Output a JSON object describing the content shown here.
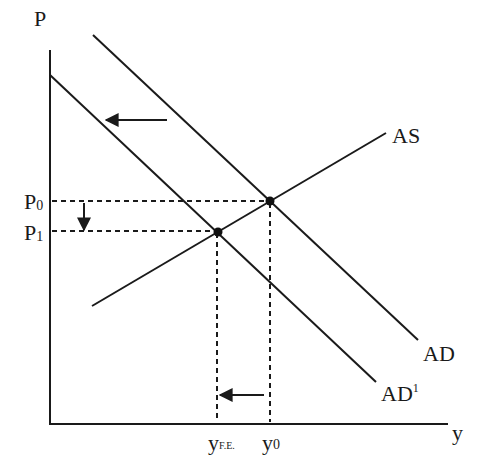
{
  "diagram": {
    "type": "aggregate supply / aggregate demand shift",
    "axes": {
      "y_label": "P",
      "x_label": "y"
    },
    "curves": [
      {
        "id": "AD",
        "label": "AD"
      },
      {
        "id": "AD1",
        "label": "AD",
        "superscript": "1"
      },
      {
        "id": "AS",
        "label": "AS"
      }
    ],
    "price_levels": [
      {
        "id": "P0",
        "base": "P",
        "sub": "0"
      },
      {
        "id": "P1",
        "base": "P",
        "sub": "1"
      }
    ],
    "output_levels": [
      {
        "id": "yFE",
        "base": "y",
        "sub": "F.E."
      },
      {
        "id": "y0",
        "base": "y",
        "sub": "0"
      }
    ],
    "equilibria": [
      {
        "id": "E0",
        "at": "P0,y0"
      },
      {
        "id": "E1",
        "at": "P1,yFE"
      }
    ],
    "arrows": [
      {
        "id": "ad-shift-arrow",
        "direction": "left"
      },
      {
        "id": "price-drop-arrow",
        "direction": "down"
      },
      {
        "id": "output-shift-arrow",
        "direction": "left"
      }
    ],
    "colors": {
      "ink": "#1a1a1a",
      "background": "#ffffff"
    }
  }
}
